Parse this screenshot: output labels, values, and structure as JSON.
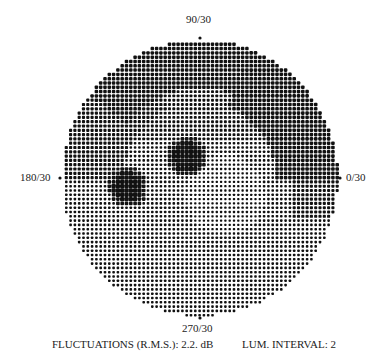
{
  "chart_data": {
    "type": "heatmap",
    "axes_labels": {
      "top": "90/30",
      "left": "180/30",
      "right": "0/30",
      "bottom": "270/30"
    },
    "field": {
      "center": [
        200,
        178
      ],
      "radius": 138,
      "dot_pitch": 4.3
    },
    "regions": [
      {
        "name": "superior arcuate defect",
        "level": "dark",
        "description": "dense dark band along upper and upper-right periphery"
      },
      {
        "name": "dark scotoma 1",
        "center": [
          128,
          187
        ],
        "radius": 15,
        "level": "black"
      },
      {
        "name": "dark scotoma 2",
        "center": [
          187,
          157
        ],
        "radius": 15,
        "level": "black"
      },
      {
        "name": "central/inferior field",
        "level": "medium",
        "description": "regular mid-grey dot grid"
      },
      {
        "name": "right nasal area",
        "level": "light-dark",
        "description": "darker shading near 0/30 horizontally"
      }
    ],
    "fluctuations_rms_db": 2.2,
    "lum_interval": 2
  },
  "labels": {
    "top": "90/30",
    "left": "180/30",
    "right": "0/30",
    "bottom": "270/30"
  },
  "footer": {
    "fluctuations": "FLUCTUATIONS (R.M.S.): 2.2. dB",
    "lum_interval": "LUM. INTERVAL: 2"
  }
}
